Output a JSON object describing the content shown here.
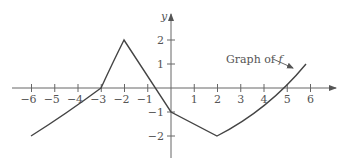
{
  "chart_data": {
    "type": "line",
    "title": "",
    "xlabel": "",
    "ylabel": "y",
    "xlim": [
      -6.6,
      7.2
    ],
    "ylim": [
      -3,
      3
    ],
    "grid": false,
    "x_ticks": [
      -6,
      -5,
      -4,
      -3,
      -2,
      -1,
      1,
      2,
      3,
      4,
      5,
      6
    ],
    "x_tick_labels": [
      "−6",
      "−5",
      "−4",
      "−3",
      "−2",
      "−1",
      "1",
      "2",
      "3",
      "4",
      "5",
      "6"
    ],
    "y_ticks": [
      2,
      1,
      -1,
      -2
    ],
    "y_tick_labels": [
      "2",
      "1",
      "−1",
      "−2"
    ],
    "series": [
      {
        "name": "f",
        "x": [
          -6,
          -5,
          -4,
          -3,
          -2.5,
          -2,
          -1,
          0,
          1,
          2,
          3,
          4,
          5,
          5.8
        ],
        "y": [
          -2,
          -1.4,
          -0.75,
          0,
          1.1,
          2,
          0.5,
          -1,
          -1.5,
          -2,
          -1.5,
          -0.85,
          0,
          1
        ]
      }
    ],
    "annotations": [
      {
        "text": "Graph of ",
        "italic_suffix": "f",
        "arrow_to": [
          5.5,
          0.6
        ]
      }
    ]
  },
  "labels": {
    "y_axis": "y",
    "annotation_prefix": "Graph of ",
    "annotation_var": "f"
  }
}
